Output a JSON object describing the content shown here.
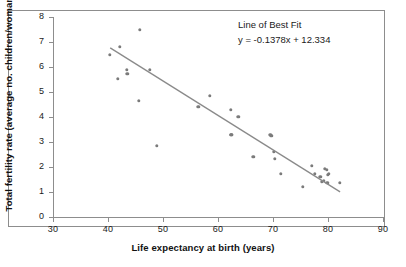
{
  "chart_data": {
    "type": "scatter",
    "title": "",
    "xlabel": "Life expectancy at birth (years)",
    "ylabel": "Total fertility rate (average no. children/woman)",
    "xlim": [
      30,
      90
    ],
    "ylim": [
      0,
      8
    ],
    "xticks": [
      30,
      40,
      50,
      60,
      70,
      80,
      90
    ],
    "yticks": [
      0,
      1,
      2,
      3,
      4,
      5,
      6,
      7,
      8
    ],
    "grid": false,
    "legend": "none",
    "point_color": "#7b7b7b",
    "line_color": "#8a8a8a",
    "annotations": {
      "title": "Line of Best Fit",
      "equation": "y = -0.1378x + 12.334"
    },
    "trendline": {
      "slope": -0.1378,
      "intercept": 12.334,
      "x_start": 40.4,
      "x_end": 82.2
    },
    "points": [
      {
        "x": 40.3,
        "y": 6.5
      },
      {
        "x": 41.8,
        "y": 5.52
      },
      {
        "x": 42.2,
        "y": 6.8
      },
      {
        "x": 43.4,
        "y": 5.9
      },
      {
        "x": 43.5,
        "y": 5.72
      },
      {
        "x": 45.8,
        "y": 7.48
      },
      {
        "x": 45.6,
        "y": 4.66
      },
      {
        "x": 47.6,
        "y": 5.88
      },
      {
        "x": 48.9,
        "y": 2.84
      },
      {
        "x": 56.4,
        "y": 4.4
      },
      {
        "x": 58.5,
        "y": 4.85
      },
      {
        "x": 62.3,
        "y": 4.3
      },
      {
        "x": 62.4,
        "y": 3.29
      },
      {
        "x": 63.7,
        "y": 4.02
      },
      {
        "x": 66.4,
        "y": 2.4
      },
      {
        "x": 69.5,
        "y": 3.3
      },
      {
        "x": 69.7,
        "y": 3.24
      },
      {
        "x": 70.2,
        "y": 2.61
      },
      {
        "x": 70.3,
        "y": 2.34
      },
      {
        "x": 71.4,
        "y": 1.74
      },
      {
        "x": 75.4,
        "y": 1.21
      },
      {
        "x": 77.0,
        "y": 2.06
      },
      {
        "x": 77.6,
        "y": 1.74
      },
      {
        "x": 78.6,
        "y": 1.62
      },
      {
        "x": 78.9,
        "y": 1.4
      },
      {
        "x": 79.2,
        "y": 1.44
      },
      {
        "x": 79.4,
        "y": 1.93
      },
      {
        "x": 79.8,
        "y": 1.88
      },
      {
        "x": 80.0,
        "y": 1.7
      },
      {
        "x": 80.1,
        "y": 1.72
      },
      {
        "x": 79.9,
        "y": 1.38
      },
      {
        "x": 82.1,
        "y": 1.36
      },
      {
        "x": 62.4,
        "y": 3.28
      }
    ]
  }
}
